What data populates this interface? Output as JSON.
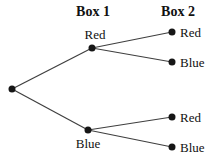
{
  "diagram": {
    "title_box1": "Box 1",
    "title_box2": "Box 2",
    "colors": {
      "background": "#ffffff",
      "line": "#3f3f3f",
      "node": "#161616",
      "text": "#111111"
    },
    "nodes": [
      {
        "id": "start",
        "label": "",
        "x": 12,
        "y": 89
      },
      {
        "id": "box1-red",
        "label": "Red",
        "x": 92,
        "y": 48
      },
      {
        "id": "box1-blue",
        "label": "Blue",
        "x": 88,
        "y": 130
      },
      {
        "id": "box2-red-top",
        "label": "Red",
        "x": 172,
        "y": 32
      },
      {
        "id": "box2-blue-top",
        "label": "Blue",
        "x": 172,
        "y": 62
      },
      {
        "id": "box2-red-bottom",
        "label": "Red",
        "x": 172,
        "y": 117
      },
      {
        "id": "box2-blue-bottom",
        "label": "Blue",
        "x": 172,
        "y": 147
      }
    ],
    "edges": [
      {
        "from": "start",
        "to": "box1-red"
      },
      {
        "from": "start",
        "to": "box1-blue"
      },
      {
        "from": "box1-red",
        "to": "box2-red-top"
      },
      {
        "from": "box1-red",
        "to": "box2-blue-top"
      },
      {
        "from": "box1-blue",
        "to": "box2-red-bottom"
      },
      {
        "from": "box1-blue",
        "to": "box2-blue-bottom"
      }
    ],
    "node_radius": 3.5,
    "line_width": 1.2
  }
}
